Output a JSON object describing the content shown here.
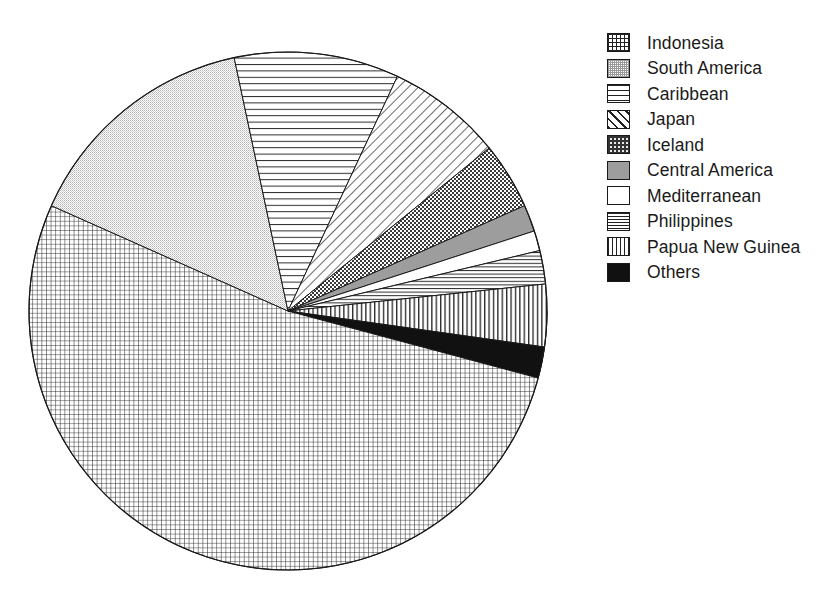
{
  "chart_data": {
    "type": "pie",
    "title": "",
    "subtitle": "",
    "xlabel": "",
    "ylabel": "",
    "grid": false,
    "legend_position": "right",
    "start_angle_deg_from_12_oclock": 90,
    "direction": "clockwise",
    "categories": [
      "Indonesia",
      "South America",
      "Caribbean",
      "Japan",
      "Iceland",
      "Central America",
      "Mediterranean",
      "Philippines",
      "Papua New Guinea",
      "Others"
    ],
    "values": [
      56.7,
      15.0,
      10.3,
      7.2,
      4.1,
      1.7,
      1.2,
      2.1,
      3.9,
      1.9
    ],
    "units": "percent",
    "slices": [
      {
        "label": "Indonesia",
        "value": 56.7,
        "start_deg": 90,
        "end_deg": 294,
        "sweep_deg": 204,
        "pattern": "fine-grid",
        "swatch_class": "sw-grid-fine"
      },
      {
        "label": "South America",
        "value": 15.0,
        "start_deg": 294,
        "end_deg": 348,
        "sweep_deg": 54,
        "pattern": "light-stipple",
        "swatch_class": "sw-stipple"
      },
      {
        "label": "Caribbean",
        "value": 10.3,
        "start_deg": 348,
        "end_deg": 385,
        "sweep_deg": 37,
        "pattern": "horizontal-lines",
        "swatch_class": "sw-hline"
      },
      {
        "label": "Japan",
        "value": 7.2,
        "start_deg": 385,
        "end_deg": 411,
        "sweep_deg": 26,
        "pattern": "diagonal-hatch",
        "swatch_class": "sw-diag"
      },
      {
        "label": "Iceland",
        "value": 4.1,
        "start_deg": 411,
        "end_deg": 426,
        "sweep_deg": 15,
        "pattern": "checkerboard",
        "swatch_class": "sw-checker"
      },
      {
        "label": "Central America",
        "value": 1.7,
        "start_deg": 426,
        "end_deg": 432,
        "sweep_deg": 6,
        "pattern": "solid-gray",
        "swatch_class": "sw-solid-gray"
      },
      {
        "label": "Mediterranean",
        "value": 1.2,
        "start_deg": 432,
        "end_deg": 436.5,
        "sweep_deg": 4.5,
        "pattern": "white",
        "swatch_class": "sw-white"
      },
      {
        "label": "Philippines",
        "value": 2.1,
        "start_deg": 436.5,
        "end_deg": 444,
        "sweep_deg": 7.5,
        "pattern": "tight-horizontal-lines",
        "swatch_class": "sw-hline-tight"
      },
      {
        "label": "Papua New Guinea",
        "value": 3.9,
        "start_deg": 444,
        "end_deg": 458,
        "sweep_deg": 14,
        "pattern": "vertical-lines",
        "swatch_class": "sw-vline"
      },
      {
        "label": "Others",
        "value": 1.9,
        "start_deg": 458,
        "end_deg": 465,
        "sweep_deg": 7,
        "pattern": "solid-black",
        "swatch_class": "sw-black"
      }
    ],
    "geometry": {
      "center_x": 288,
      "center_y": 311,
      "radius": 259
    }
  },
  "legend": {
    "items": [
      {
        "label": "Indonesia"
      },
      {
        "label": "South America"
      },
      {
        "label": "Caribbean"
      },
      {
        "label": "Japan"
      },
      {
        "label": "Iceland"
      },
      {
        "label": "Central America"
      },
      {
        "label": "Mediterranean"
      },
      {
        "label": "Philippines"
      },
      {
        "label": "Papua New Guinea"
      },
      {
        "label": "Others"
      }
    ]
  },
  "colors": {
    "ink": "#1a1a1a",
    "background": "#ffffff",
    "gray_fill": "#9d9d9d",
    "black_fill": "#111111",
    "stipple_fill": "#d9d9d9"
  }
}
